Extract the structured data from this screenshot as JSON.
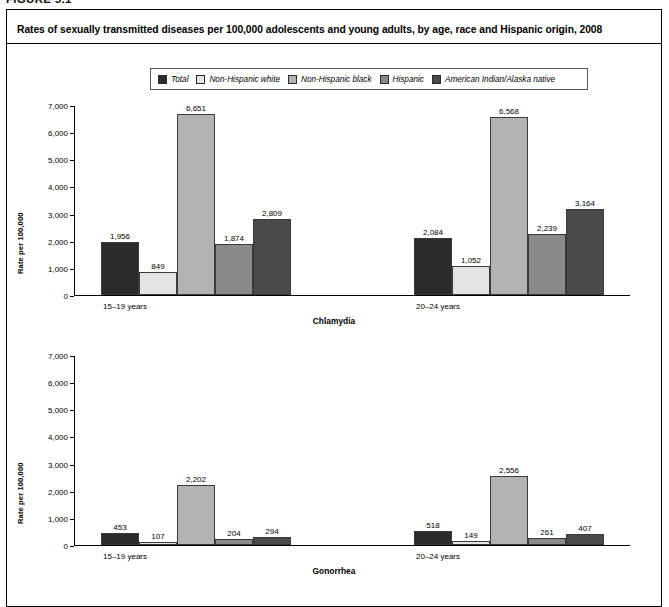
{
  "figure": {
    "number_label": "FIGURE 5.1",
    "title": "Rates of sexually transmitted diseases per 100,000 adolescents and young adults, by age, race and Hispanic origin, 2008"
  },
  "legend": {
    "items": [
      {
        "label": "Total",
        "color": "#2b2b2b",
        "icon": "legend-swatch-icon"
      },
      {
        "label": "Non-Hispanic white",
        "color": "#e4e4e4",
        "icon": "legend-swatch-icon"
      },
      {
        "label": "Non-Hispanic black",
        "color": "#b3b3b3",
        "icon": "legend-swatch-icon"
      },
      {
        "label": "Hispanic",
        "color": "#8a8a8a",
        "icon": "legend-swatch-icon"
      },
      {
        "label": "American Indian/Alaska native",
        "color": "#4a4a4a",
        "icon": "legend-swatch-icon"
      }
    ]
  },
  "axis": {
    "ylabel": "Rate per 100,000",
    "yticks": [
      "0",
      "1,000",
      "2,000",
      "3,000",
      "4,000",
      "5,000",
      "6,000",
      "7,000"
    ]
  },
  "chart_data": [
    {
      "type": "bar",
      "title": "Chlamydia",
      "xlabel": "",
      "ylabel": "Rate per 100,000",
      "ylim": [
        0,
        7000
      ],
      "ytick_values": [
        0,
        1000,
        2000,
        3000,
        4000,
        5000,
        6000,
        7000
      ],
      "grid": false,
      "legend_position": "top-center",
      "categories": [
        "15–19 years",
        "20–24 years"
      ],
      "series": [
        {
          "name": "Total",
          "color": "#2b2b2b",
          "values": [
            1956,
            2084
          ],
          "labels": [
            "1,956",
            "2,084"
          ]
        },
        {
          "name": "Non-Hispanic white",
          "color": "#e4e4e4",
          "values": [
            849,
            1052
          ],
          "labels": [
            "849",
            "1,052"
          ]
        },
        {
          "name": "Non-Hispanic black",
          "color": "#b3b3b3",
          "values": [
            6651,
            6568
          ],
          "labels": [
            "6,651",
            "6,568"
          ]
        },
        {
          "name": "Hispanic",
          "color": "#8a8a8a",
          "values": [
            1874,
            2239
          ],
          "labels": [
            "1,874",
            "2,239"
          ]
        },
        {
          "name": "American Indian/Alaska native",
          "color": "#4a4a4a",
          "values": [
            2809,
            3164
          ],
          "labels": [
            "2,809",
            "3,164"
          ]
        }
      ]
    },
    {
      "type": "bar",
      "title": "Gonorrhea",
      "xlabel": "",
      "ylabel": "Rate per 100,000",
      "ylim": [
        0,
        7000
      ],
      "ytick_values": [
        0,
        1000,
        2000,
        3000,
        4000,
        5000,
        6000,
        7000
      ],
      "grid": false,
      "legend_position": "top-center",
      "categories": [
        "15–19 years",
        "20–24 years"
      ],
      "series": [
        {
          "name": "Total",
          "color": "#2b2b2b",
          "values": [
            453,
            518
          ],
          "labels": [
            "453",
            "518"
          ]
        },
        {
          "name": "Non-Hispanic white",
          "color": "#e4e4e4",
          "values": [
            107,
            149
          ],
          "labels": [
            "107",
            "149"
          ]
        },
        {
          "name": "Non-Hispanic black",
          "color": "#b3b3b3",
          "values": [
            2202,
            2556
          ],
          "labels": [
            "2,202",
            "2,556"
          ]
        },
        {
          "name": "Hispanic",
          "color": "#8a8a8a",
          "values": [
            204,
            261
          ],
          "labels": [
            "204",
            "261"
          ]
        },
        {
          "name": "American Indian/Alaska native",
          "color": "#4a4a4a",
          "values": [
            294,
            407
          ],
          "labels": [
            "294",
            "407"
          ]
        }
      ]
    }
  ]
}
